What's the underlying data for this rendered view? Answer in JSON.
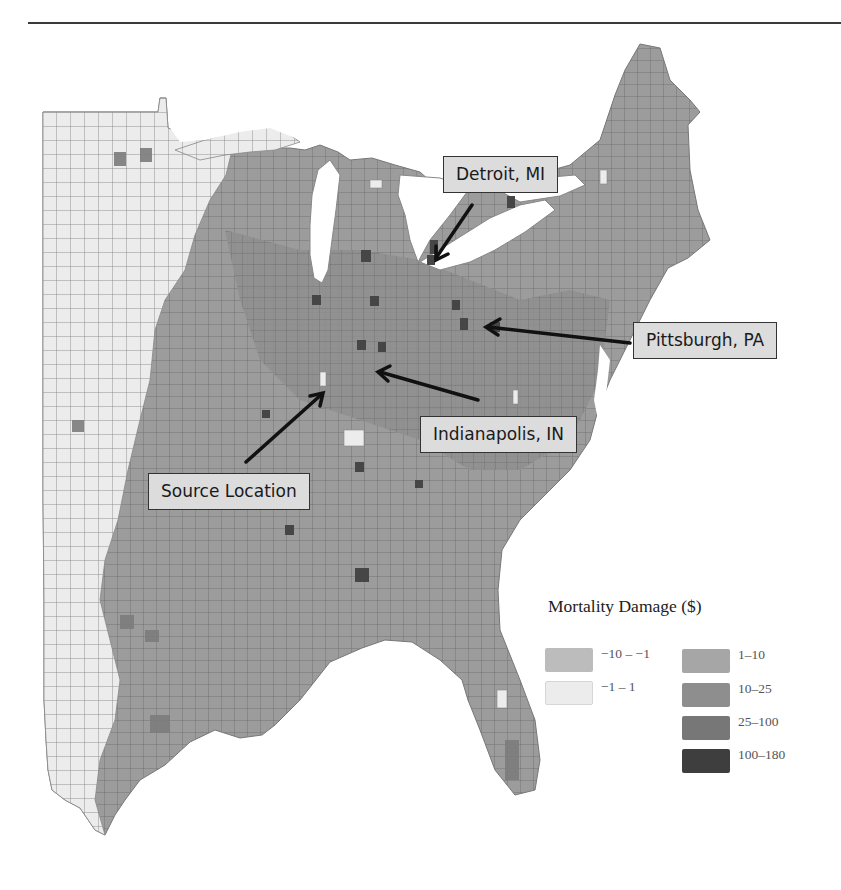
{
  "figure": {
    "title_rule": true,
    "legend": {
      "title": "Mortality Damage ($)",
      "items": [
        {
          "label": "−10 –  −1",
          "color": "#bcbcbc"
        },
        {
          "label": "−1 – 1",
          "color": "#ececec"
        },
        {
          "label": "1–10",
          "color": "#a6a6a6"
        },
        {
          "label": "10–25",
          "color": "#8e8e8e"
        },
        {
          "label": "25–100",
          "color": "#777777"
        },
        {
          "label": "100–180",
          "color": "#3e3e3e"
        }
      ]
    },
    "callouts": [
      {
        "id": "detroit",
        "label": "Detroit, MI"
      },
      {
        "id": "pittsburgh",
        "label": "Pittsburgh, PA"
      },
      {
        "id": "indianapolis",
        "label": "Indianapolis, IN"
      },
      {
        "id": "source",
        "label": "Source Location"
      }
    ],
    "colors": {
      "land_light": "#ececec",
      "land_mid": "#9a9a9a",
      "land_dark": "#808080",
      "hot": "#4a4a4a",
      "county_border": "#6e6e6e",
      "water": "#ffffff"
    }
  }
}
